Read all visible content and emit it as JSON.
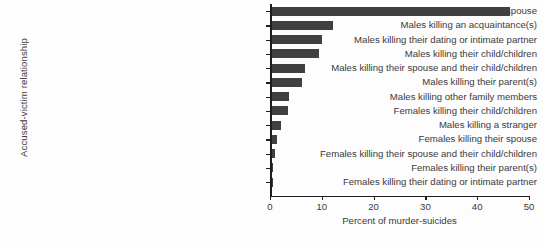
{
  "chart_data": {
    "type": "bar",
    "orientation": "horizontal",
    "title": "",
    "xlabel": "Percent of murder-suicides",
    "ylabel": "Accused-victim relationship",
    "xlim": [
      0,
      50
    ],
    "xticks": [
      0,
      10,
      20,
      30,
      40,
      50
    ],
    "xticklabels": [
      "0",
      "10",
      "20",
      "30",
      "40",
      "50"
    ],
    "grid": false,
    "legend": false,
    "bar_color": "#404040",
    "background_color": "#fdfdfd",
    "categories": [
      "Males killing their spouse",
      "Males killing an acquaintance(s)",
      "Males killing their dating or intimate partner",
      "Males killing their child/children",
      "Males killing their spouse and their child/children",
      "Males killing their parent(s)",
      "Males killing other family members",
      "Females killing their child/children",
      "Males killing a stranger",
      "Females killing their spouse",
      "Females killing their spouse and their child/children",
      "Females killing their parent(s)",
      "Females killing their dating or intimate partner"
    ],
    "values": [
      46.0,
      11.8,
      9.8,
      9.2,
      6.4,
      5.9,
      3.4,
      3.2,
      1.9,
      1.0,
      0.6,
      0.1,
      0.05
    ]
  }
}
